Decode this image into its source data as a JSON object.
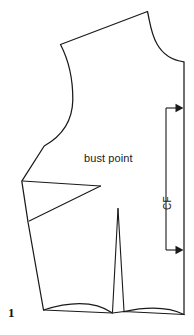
{
  "figure": {
    "number": "1",
    "type": "sewing-pattern-diagram",
    "background_color": "#ffffff",
    "line_color": "#1a1a1a"
  },
  "labels": {
    "bust_point": "bust point",
    "center_front": "CF"
  },
  "annotations": {
    "grainline": {
      "name": "grainline-with-arrows",
      "orientation": "vertical",
      "arrow_direction": "right",
      "arrow_count": 2
    }
  },
  "pattern_pieces": {
    "outline_name": "front-bodice-outline",
    "bust_dart_name": "bust-dart",
    "waist_dart_name": "waist-dart"
  }
}
